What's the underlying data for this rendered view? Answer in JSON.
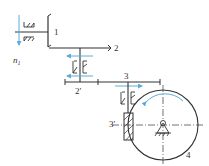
{
  "diagram": {
    "type": "gear-train-schematic",
    "labels": {
      "gear1": "1",
      "gear2": "2",
      "gear2p": "2′",
      "gear3": "3",
      "worm3p": "3′",
      "wheel4": "4",
      "n1": "n",
      "n1_sub": "1"
    },
    "colors": {
      "line": "#333333",
      "arrow": "#5aaed8",
      "background": "#ffffff"
    }
  }
}
